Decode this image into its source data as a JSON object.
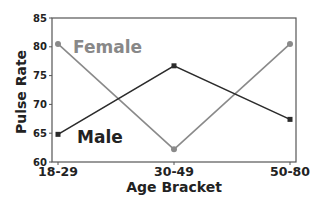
{
  "chart_data": {
    "type": "line",
    "title": "",
    "xlabel": "Age Bracket",
    "ylabel": "Pulse Rate",
    "categories": [
      "18-29",
      "30-49",
      "50-80"
    ],
    "ylim": [
      60,
      85
    ],
    "yticks": [
      60,
      65,
      70,
      75,
      80,
      85
    ],
    "grid": false,
    "legend_position": "inline labels",
    "series": [
      {
        "name": "Female",
        "values": [
          80.5,
          62.2,
          80.5
        ],
        "color": "#8a8a8a",
        "marker": "circle"
      },
      {
        "name": "Male",
        "values": [
          64.8,
          76.7,
          67.4
        ],
        "color": "#2b2b2b",
        "marker": "square"
      }
    ]
  },
  "labels": {
    "female": "Female",
    "male": "Male",
    "xlabel": "Age Bracket",
    "ylabel": "Pulse Rate"
  }
}
